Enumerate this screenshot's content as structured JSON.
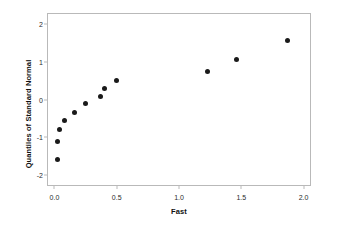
{
  "chart_data": {
    "type": "scatter",
    "title": "",
    "xlabel": "Fast",
    "ylabel": "Quantiles of Standard Normal",
    "xlim": [
      -0.06,
      2.06
    ],
    "ylim": [
      -2.3,
      2.3
    ],
    "grid": false,
    "legend": null,
    "xticks": [
      "0.0",
      "0.5",
      "1.0",
      "1.5",
      "2.0"
    ],
    "xtick_values": [
      0.0,
      0.5,
      1.0,
      1.5,
      2.0
    ],
    "yticks": [
      "2",
      "1",
      "0",
      "-1",
      "-2"
    ],
    "ytick_values": [
      2,
      1,
      0,
      -1,
      -2
    ],
    "marker": "filled-circle",
    "marker_color": "#1a1a1a",
    "points": [
      {
        "x": 0.02,
        "y": -1.58
      },
      {
        "x": 0.02,
        "y": -1.1
      },
      {
        "x": 0.03,
        "y": -0.78
      },
      {
        "x": 0.07,
        "y": -0.52
      },
      {
        "x": 0.15,
        "y": -0.31
      },
      {
        "x": 0.24,
        "y": -0.09
      },
      {
        "x": 0.36,
        "y": 0.11
      },
      {
        "x": 0.39,
        "y": 0.31
      },
      {
        "x": 0.49,
        "y": 0.52
      },
      {
        "x": 1.22,
        "y": 0.78
      },
      {
        "x": 1.45,
        "y": 1.09
      },
      {
        "x": 1.86,
        "y": 1.59
      }
    ]
  },
  "colors": {
    "background": "#ffffff",
    "frame": "#b9b9b9",
    "marker": "#1a1a1a",
    "text": "#2b2b2b",
    "title_text": "#111111"
  }
}
